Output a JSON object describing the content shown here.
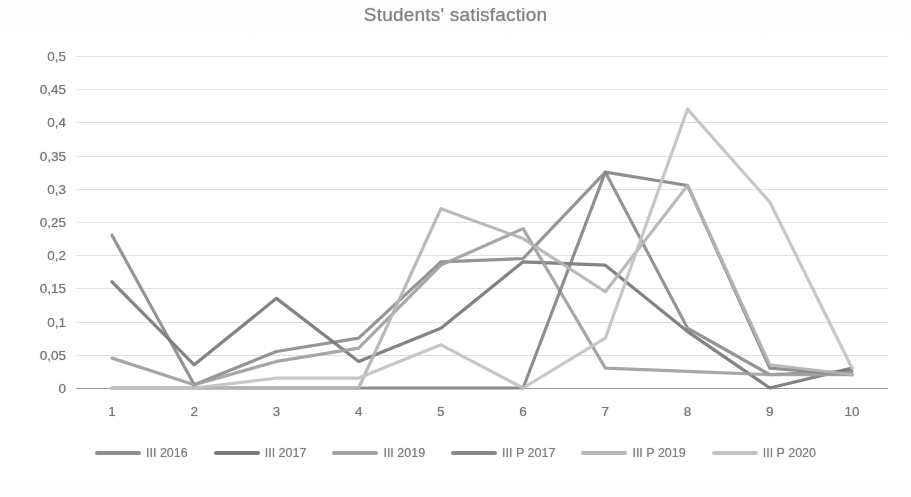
{
  "chart_data": {
    "type": "line",
    "title": "Students' satisfaction",
    "xlabel": "",
    "ylabel": "",
    "grid": true,
    "legend_position": "bottom",
    "decimal_separator": ",",
    "x": [
      1,
      2,
      3,
      4,
      5,
      6,
      7,
      8,
      9,
      10
    ],
    "xtick_labels": [
      "1",
      "2",
      "3",
      "4",
      "5",
      "6",
      "7",
      "8",
      "9",
      "10"
    ],
    "ylim": [
      0,
      0.5
    ],
    "ytick_values": [
      0.5,
      0.45,
      0.4,
      0.35,
      0.3,
      0.25,
      0.2,
      0.15,
      0.1,
      0.05,
      0
    ],
    "ytick_labels": [
      "0,5",
      "0,45",
      "0,4",
      "0,35",
      "0,3",
      "0,25",
      "0,2",
      "0,15",
      "0,1",
      "0,05",
      "0"
    ],
    "series": [
      {
        "name": "III 2016",
        "color": "#8c8c8c",
        "values": [
          0.23,
          0.005,
          0.055,
          0.075,
          0.19,
          0.195,
          0.325,
          0.09,
          0.02,
          0.025
        ]
      },
      {
        "name": "III 2017",
        "color": "#787878",
        "values": [
          0.16,
          0.035,
          0.135,
          0.04,
          0.09,
          0.19,
          0.185,
          0.085,
          0.0,
          0.03
        ]
      },
      {
        "name": "III 2019",
        "color": "#a0a0a0",
        "values": [
          0.045,
          0.005,
          0.04,
          0.06,
          0.185,
          0.24,
          0.03,
          0.025,
          0.02,
          0.02
        ]
      },
      {
        "name": "III P 2017",
        "color": "#868686",
        "values": [
          0.0,
          0.0,
          0.0,
          0.0,
          0.0,
          0.0,
          0.325,
          0.305,
          0.03,
          0.02
        ]
      },
      {
        "name": "III P 2019",
        "color": "#b4b4b4",
        "values": [
          0.0,
          0.0,
          0.0,
          0.0,
          0.27,
          0.225,
          0.145,
          0.305,
          0.035,
          0.02
        ]
      },
      {
        "name": "III P 2020",
        "color": "#c2c2c2",
        "values": [
          0.0,
          0.0,
          0.015,
          0.015,
          0.065,
          0.0,
          0.075,
          0.42,
          0.28,
          0.03
        ]
      }
    ]
  },
  "chart": {
    "title": "Students' satisfaction"
  },
  "legend": {
    "items": [
      {
        "label": "III 2016"
      },
      {
        "label": "III 2017"
      },
      {
        "label": "III 2019"
      },
      {
        "label": "III P 2017"
      },
      {
        "label": "III P 2019"
      },
      {
        "label": "III P 2020"
      }
    ]
  }
}
